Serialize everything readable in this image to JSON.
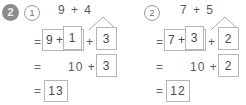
{
  "worksheet": {
    "exercise_number": "2",
    "problems": [
      {
        "index_label": "1",
        "top_expression": "9 + 4",
        "addend_a": "9",
        "addend_b": "4",
        "row1": {
          "equals": "=",
          "group_prefix": "9 +",
          "make_ten_part": "1",
          "plus": "+",
          "remainder": "3"
        },
        "row2": {
          "equals": "=",
          "ten": "10 +",
          "remainder": "3"
        },
        "row3": {
          "equals": "=",
          "answer": "13"
        }
      },
      {
        "index_label": "2",
        "top_expression": "7 + 5",
        "addend_a": "7",
        "addend_b": "5",
        "row1": {
          "equals": "=",
          "group_prefix": "7 +",
          "make_ten_part": "3",
          "plus": "+",
          "remainder": "2"
        },
        "row2": {
          "equals": "=",
          "ten": "10 +",
          "remainder": "2"
        },
        "row3": {
          "equals": "=",
          "answer": "12"
        }
      }
    ]
  },
  "colors": {
    "badge_fill": "#8c8c8c",
    "box_border": "#b6b6b6",
    "text": "#585858",
    "background": "#ffffff"
  }
}
